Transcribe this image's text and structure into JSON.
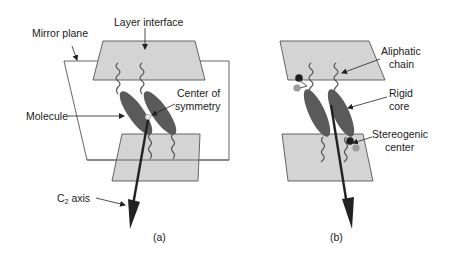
{
  "figure": {
    "panels": [
      {
        "id": "a",
        "caption": "(a)",
        "labels": {
          "mirror_plane": "Mirror plane",
          "layer_interface": "Layer interface",
          "molecule": "Molecule",
          "center_of_symmetry_line1": "Center of",
          "center_of_symmetry_line2": "symmetry",
          "c2_axis_prefix": "C",
          "c2_axis_subscript": "2",
          "c2_axis_suffix": " axis"
        }
      },
      {
        "id": "b",
        "caption": "(b)",
        "labels": {
          "aliphatic_line1": "Aliphatic",
          "aliphatic_line2": "chain",
          "rigid_line1": "Rigid",
          "rigid_line2": "core",
          "stereogenic_line1": "Stereogenic",
          "stereogenic_line2": "center"
        }
      }
    ],
    "colors": {
      "layer_fill": "#d4d4d4",
      "layer_stroke": "#555555",
      "core_fill": "#5a5a5a",
      "axis": "#222222",
      "stereo_dark": "#1e1e1e",
      "stereo_light": "#9a9a9a",
      "center_point": "#e6e6e6"
    }
  }
}
